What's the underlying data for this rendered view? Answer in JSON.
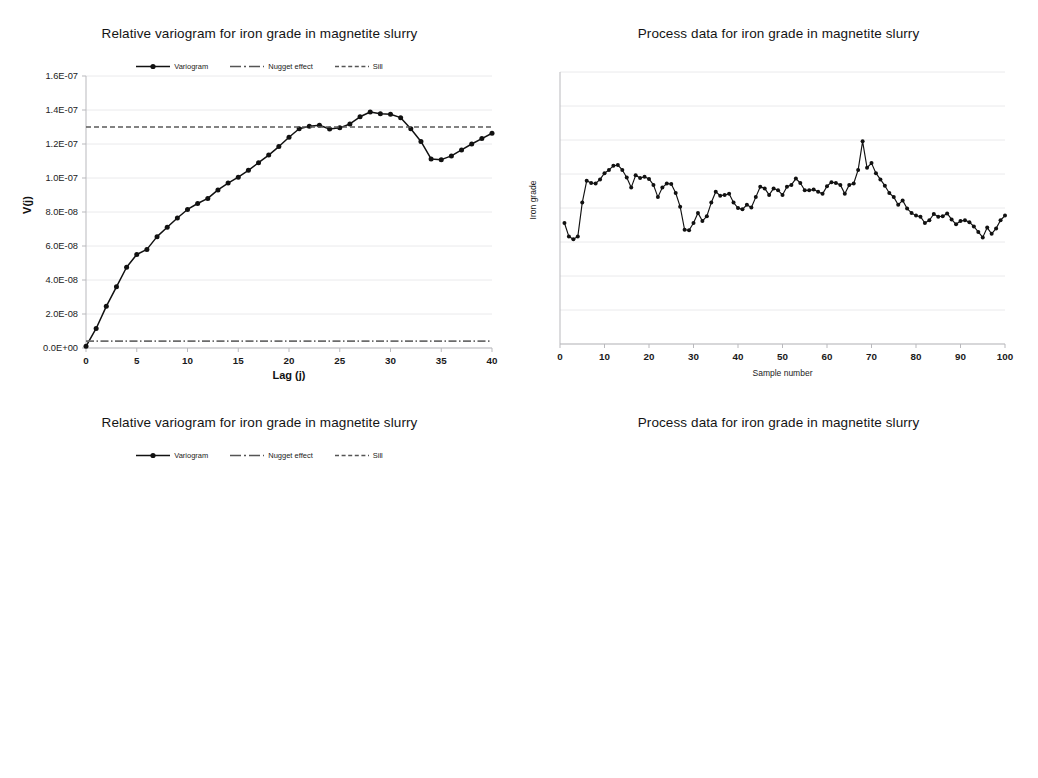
{
  "figure": {
    "panels": [
      {
        "id": "top-left",
        "title": "Relative variogram for iron grade in magnetite slurry",
        "legend": [
          {
            "label": "Variogram",
            "style": "line-marker"
          },
          {
            "label": "Nugget effect",
            "style": "dash-dot"
          },
          {
            "label": "Sill",
            "style": "dashed"
          }
        ]
      },
      {
        "id": "top-right",
        "title": "Process data for iron grade in magnetite slurry",
        "legend": []
      },
      {
        "id": "bottom-left",
        "title": "Relative variogram for iron grade in magnetite slurry",
        "legend": [
          {
            "label": "Variogram",
            "style": "line-marker"
          },
          {
            "label": "Nugget effect",
            "style": "dash-dot"
          },
          {
            "label": "Sill",
            "style": "dashed"
          }
        ]
      },
      {
        "id": "bottom-right",
        "title": "Process data for iron grade in magnetite slurry",
        "legend": []
      }
    ]
  },
  "chart_data": [
    {
      "id": "top-left",
      "type": "line",
      "title": "Relative variogram for iron grade in magnetite slurry",
      "xlabel": "Lag (j)",
      "ylabel": "V(j)",
      "xlim": [
        0,
        40
      ],
      "ylim": [
        0,
        1.6e-07
      ],
      "xticks": [
        0,
        5,
        10,
        15,
        20,
        25,
        30,
        35,
        40
      ],
      "yticks": [
        0,
        2e-08,
        4e-08,
        6e-08,
        8e-08,
        1e-07,
        1.2e-07,
        1.4e-07,
        1.6e-07
      ],
      "ytick_labels": [
        "0.0E+00",
        "2.0E-08",
        "4.0E-08",
        "6.0E-08",
        "8.0E-08",
        "1.0E-07",
        "1.2E-07",
        "1.4E-07",
        "1.6E-07"
      ],
      "grid": "horizontal",
      "legend_position": "top-center",
      "series": [
        {
          "name": "Variogram",
          "marker": true,
          "x": [
            0,
            1,
            2,
            3,
            4,
            5,
            6,
            7,
            8,
            9,
            10,
            11,
            12,
            13,
            14,
            15,
            16,
            17,
            18,
            19,
            20,
            21,
            22,
            23,
            24,
            25,
            26,
            27,
            28,
            29,
            30,
            31,
            32,
            33,
            34,
            35,
            36,
            37,
            38,
            39,
            40
          ],
          "values": [
            1e-09,
            1.15e-08,
            2.45e-08,
            3.6e-08,
            4.75e-08,
            5.5e-08,
            5.8e-08,
            6.55e-08,
            7.1e-08,
            7.65e-08,
            8.15e-08,
            8.5e-08,
            8.8e-08,
            9.3e-08,
            9.7e-08,
            1.005e-07,
            1.045e-07,
            1.09e-07,
            1.135e-07,
            1.185e-07,
            1.24e-07,
            1.29e-07,
            1.305e-07,
            1.31e-07,
            1.288e-07,
            1.295e-07,
            1.318e-07,
            1.36e-07,
            1.388e-07,
            1.378e-07,
            1.375e-07,
            1.355e-07,
            1.29e-07,
            1.215e-07,
            1.112e-07,
            1.108e-07,
            1.13e-07,
            1.165e-07,
            1.2e-07,
            1.232e-07,
            1.263e-07
          ]
        },
        {
          "name": "Nugget effect",
          "type": "hline",
          "value": 4e-09
        },
        {
          "name": "Sill",
          "type": "hline",
          "value": 1.3e-07
        }
      ]
    },
    {
      "id": "top-right",
      "type": "line",
      "title": "Process data for iron grade in magnetite slurry",
      "xlabel": "Sample number",
      "ylabel": "Iron grade",
      "xlim": [
        0,
        100
      ],
      "ylim": [
        0,
        1
      ],
      "xticks": [
        0,
        10,
        20,
        30,
        40,
        50,
        60,
        70,
        80,
        90,
        100
      ],
      "ytick_labels": [],
      "grid": "horizontal",
      "legend_position": "none",
      "series": [
        {
          "name": "Iron grade",
          "marker": true,
          "x": [
            1,
            2,
            3,
            4,
            5,
            6,
            7,
            8,
            9,
            10,
            11,
            12,
            13,
            14,
            15,
            16,
            17,
            18,
            19,
            20,
            21,
            22,
            23,
            24,
            25,
            26,
            27,
            28,
            29,
            30,
            31,
            32,
            33,
            34,
            35,
            36,
            37,
            38,
            39,
            40,
            41,
            42,
            43,
            44,
            45,
            46,
            47,
            48,
            49,
            50,
            51,
            52,
            53,
            54,
            55,
            56,
            57,
            58,
            59,
            60,
            61,
            62,
            63,
            64,
            65,
            66,
            67,
            68,
            69,
            70,
            71,
            72,
            73,
            74,
            75,
            76,
            77,
            78,
            79,
            80,
            81,
            82,
            83,
            84,
            85,
            86,
            87,
            88,
            89,
            90,
            91,
            92,
            93,
            94,
            95,
            96,
            97,
            98,
            99,
            100
          ],
          "values": [
            0.445,
            0.395,
            0.385,
            0.395,
            0.52,
            0.6,
            0.592,
            0.59,
            0.605,
            0.628,
            0.64,
            0.655,
            0.658,
            0.64,
            0.612,
            0.575,
            0.62,
            0.61,
            0.615,
            0.607,
            0.585,
            0.54,
            0.575,
            0.59,
            0.588,
            0.555,
            0.505,
            0.42,
            0.418,
            0.445,
            0.482,
            0.452,
            0.47,
            0.52,
            0.56,
            0.545,
            0.548,
            0.552,
            0.52,
            0.5,
            0.495,
            0.512,
            0.502,
            0.54,
            0.578,
            0.572,
            0.548,
            0.572,
            0.565,
            0.548,
            0.578,
            0.585,
            0.608,
            0.592,
            0.565,
            0.565,
            0.568,
            0.56,
            0.552,
            0.58,
            0.595,
            0.592,
            0.585,
            0.552,
            0.585,
            0.59,
            0.64,
            0.745,
            0.648,
            0.665,
            0.628,
            0.605,
            0.582,
            0.555,
            0.54,
            0.512,
            0.528,
            0.498,
            0.482,
            0.472,
            0.468,
            0.445,
            0.455,
            0.478,
            0.468,
            0.47,
            0.48,
            0.458,
            0.44,
            0.452,
            0.455,
            0.448,
            0.432,
            0.412,
            0.392,
            0.428,
            0.405,
            0.425,
            0.455,
            0.472
          ]
        }
      ]
    },
    {
      "id": "bottom-left",
      "type": "line",
      "title": "Relative variogram for iron grade in magnetite slurry",
      "xlabel": "Lag (j)",
      "ylabel": "V(j)",
      "xlim": [
        0,
        45
      ],
      "ylim": [
        0,
        1.6e-07
      ],
      "xticks": [
        0,
        5,
        10,
        15,
        20,
        25,
        30,
        35,
        40,
        45
      ],
      "yticks": [
        0,
        2e-08,
        4e-08,
        6e-08,
        8e-08,
        1e-07,
        1.2e-07,
        1.4e-07,
        1.6e-07
      ],
      "ytick_labels": [
        "0.0E+00",
        "2.0E-08",
        "4.0E-08",
        "6.0E-08",
        "8.0E-08",
        "1.0E-07",
        "1.2E-07",
        "1.4E-07",
        "1.6E-07"
      ],
      "grid": "horizontal",
      "legend_position": "top-center",
      "series": [
        {
          "name": "Variogram",
          "marker": true,
          "x": [
            0,
            1,
            2,
            3,
            4,
            5,
            6,
            7,
            8,
            9,
            10,
            11,
            12,
            13,
            14,
            15,
            16,
            17,
            18,
            19,
            20,
            21,
            22,
            23,
            24,
            25,
            26,
            27,
            28,
            29,
            30,
            31,
            32,
            33,
            34,
            35,
            36,
            37,
            38,
            39,
            40,
            41,
            42,
            43,
            44,
            45
          ],
          "values": [
            1e-09,
            1.25e-08,
            2.5e-08,
            4.15e-08,
            5.85e-08,
            7.35e-08,
            8.8e-08,
            1.035e-07,
            1.125e-07,
            1.17e-07,
            1.192e-07,
            1.205e-07,
            1.196e-07,
            1.172e-07,
            1.135e-07,
            1.082e-07,
            1.015e-07,
            9.4e-08,
            8.6e-08,
            7.6e-08,
            6.85e-08,
            6.32e-08,
            6.38e-08,
            6.52e-08,
            7e-08,
            7.62e-08,
            8.3e-08,
            9.05e-08,
            9.65e-08,
            1.052e-07,
            1.155e-07,
            1.245e-07,
            1.225e-07,
            1.178e-07,
            1.108e-07,
            1.02e-07,
            9.35e-08,
            8.55e-08,
            7.9e-08,
            6.95e-08,
            6.92e-08,
            6.45e-08,
            6.38e-08,
            6.48e-08,
            6.82e-08,
            7.55e-08
          ]
        },
        {
          "name": "Nugget effect",
          "type": "hline",
          "value": 4e-09
        },
        {
          "name": "Sill",
          "type": "hline",
          "value": 1.25e-07
        }
      ]
    },
    {
      "id": "bottom-right",
      "type": "line",
      "title": "Process data for iron grade in magnetite slurry",
      "xlabel": "Sample number",
      "ylabel": "Iron grade",
      "xlim": [
        0,
        100
      ],
      "ylim": [
        0,
        1
      ],
      "xticks": [
        0,
        10,
        20,
        30,
        40,
        50,
        60,
        70,
        80,
        90,
        100
      ],
      "ytick_labels": [],
      "grid": "horizontal",
      "legend_position": "none",
      "series": [
        {
          "name": "Iron grade",
          "marker": true,
          "x": [
            1,
            2,
            3,
            4,
            5,
            6,
            7,
            8,
            9,
            10,
            11,
            12,
            13,
            14,
            15,
            16,
            17,
            18,
            19,
            20,
            21,
            22,
            23,
            24,
            25,
            26,
            27,
            28,
            29,
            30,
            31,
            32,
            33,
            34,
            35,
            36,
            37,
            38,
            39,
            40,
            41,
            42,
            43,
            44,
            45,
            46,
            47,
            48,
            49,
            50,
            51,
            52,
            53,
            54,
            55,
            56,
            57,
            58,
            59,
            60,
            61,
            62,
            63,
            64,
            65,
            66,
            67,
            68,
            69,
            70,
            71,
            72,
            73,
            74,
            75,
            76,
            77,
            78,
            79,
            80,
            81,
            82,
            83,
            84,
            85,
            86,
            87,
            88,
            89,
            90,
            91,
            92,
            93,
            94,
            95,
            96,
            97,
            98,
            99,
            100
          ],
          "values": [
            0.352,
            0.332,
            0.305,
            0.358,
            0.368,
            0.345,
            0.312,
            0.352,
            0.398,
            0.432,
            0.408,
            0.42,
            0.452,
            0.478,
            0.49,
            0.472,
            0.412,
            0.432,
            0.445,
            0.41,
            0.418,
            0.42,
            0.428,
            0.452,
            0.468,
            0.468,
            0.482,
            0.478,
            0.428,
            0.392,
            0.358,
            0.358,
            0.358,
            0.392,
            0.412,
            0.452,
            0.492,
            0.47,
            0.462,
            0.43,
            0.412,
            0.398,
            0.39,
            0.4,
            0.392,
            0.372,
            0.358,
            0.345,
            0.322,
            0.332,
            0.352,
            0.368,
            0.368,
            0.352,
            0.338,
            0.372,
            0.432,
            0.452,
            0.428,
            0.438,
            0.452,
            0.455,
            0.428,
            0.402,
            0.365,
            0.338,
            0.298,
            0.275,
            0.25,
            0.288,
            0.288,
            0.282,
            0.292,
            0.288,
            0.275,
            0.298,
            0.338,
            0.38,
            0.425,
            0.478,
            0.458,
            0.432,
            0.445,
            0.458,
            0.43,
            0.4,
            0.372,
            0.368,
            0.345,
            0.318,
            0.308,
            0.34,
            0.358,
            0.372,
            0.392,
            0.428,
            0.452,
            0.478,
            0.48,
            0.455
          ]
        }
      ]
    }
  ]
}
